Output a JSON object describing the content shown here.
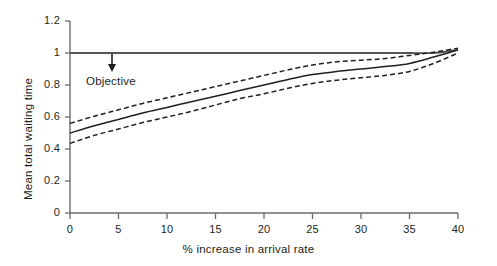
{
  "chart_data": {
    "type": "line",
    "title": "",
    "xlabel": "% increase in arrival rate",
    "ylabel": "Mean total waiting time",
    "xlim": [
      0,
      40
    ],
    "ylim": [
      0,
      1.2
    ],
    "xticks": [
      "0",
      "5",
      "10",
      "15",
      "20",
      "25",
      "30",
      "35",
      "40"
    ],
    "yticks": [
      "0",
      "0.2",
      "0.4",
      "0.6",
      "0.8",
      "1",
      "1.2"
    ],
    "grid": false,
    "legend": null,
    "x": [
      0,
      2.5,
      5,
      7.5,
      10,
      12.5,
      15,
      17.5,
      20,
      22.5,
      25,
      27.5,
      30,
      32.5,
      35,
      37.5,
      40
    ],
    "series": [
      {
        "name": "Objective",
        "style": "solid",
        "values": [
          1.0,
          1.0,
          1.0,
          1.0,
          1.0,
          1.0,
          1.0,
          1.0,
          1.0,
          1.0,
          1.0,
          1.0,
          1.0,
          1.0,
          1.0,
          1.0,
          1.02
        ]
      },
      {
        "name": "Mean total waiting time (estimate)",
        "style": "solid",
        "values": [
          0.5,
          0.545,
          0.585,
          0.625,
          0.66,
          0.695,
          0.73,
          0.765,
          0.8,
          0.835,
          0.865,
          0.885,
          0.9,
          0.915,
          0.935,
          0.975,
          1.02
        ]
      },
      {
        "name": "Upper confidence bound",
        "style": "dashed",
        "values": [
          0.56,
          0.605,
          0.645,
          0.685,
          0.72,
          0.755,
          0.79,
          0.825,
          0.86,
          0.895,
          0.925,
          0.945,
          0.955,
          0.965,
          0.985,
          1.005,
          1.03
        ]
      },
      {
        "name": "Lower confidence bound",
        "style": "dashed",
        "values": [
          0.435,
          0.485,
          0.525,
          0.565,
          0.6,
          0.635,
          0.675,
          0.715,
          0.745,
          0.78,
          0.81,
          0.83,
          0.845,
          0.86,
          0.885,
          0.935,
          1.0
        ]
      }
    ],
    "annotations": [
      {
        "text": "Objective",
        "x": 4,
        "y": 1.0,
        "arrow": "down"
      }
    ],
    "colors": {
      "axis": "#6b6b6b",
      "line": "#231f20",
      "text": "#231f20",
      "background": "#ffffff"
    }
  }
}
